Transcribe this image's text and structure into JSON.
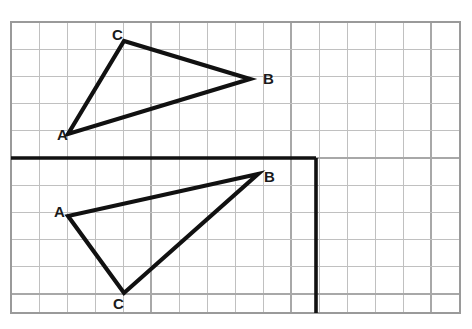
{
  "figure": {
    "background_color": "#ffffff",
    "grid": {
      "minor_color": "#c0c0c0",
      "major_color": "#a8a8a8",
      "border_color": "#9a9a9a",
      "left": 11,
      "top": 22,
      "right": 460,
      "bottom": 313,
      "cell_width": 28,
      "cell_height": 27.2,
      "columns": 16,
      "rows": 10.7,
      "major_every": 5
    },
    "axis": {
      "color": "#111111",
      "stroke_width": 3.6,
      "horizontal": {
        "x1": 11,
        "y1": 158,
        "x2": 316,
        "y2": 158
      },
      "vertical": {
        "x1": 316,
        "y1": 158,
        "x2": 316,
        "y2": 313
      }
    },
    "shapes": [
      {
        "name": "triangle-upper",
        "stroke_color": "#111111",
        "stroke_width": 4.2,
        "points": "68,134 124,41 250,79",
        "vertices": [
          {
            "label": "A",
            "x": 68,
            "y": 134,
            "label_x": 57,
            "label_y": 136
          },
          {
            "label": "C",
            "x": 124,
            "y": 41,
            "label_x": 112,
            "label_y": 36
          },
          {
            "label": "B",
            "x": 250,
            "y": 79,
            "label_x": 263,
            "label_y": 80
          }
        ]
      },
      {
        "name": "triangle-lower",
        "stroke_color": "#111111",
        "stroke_width": 4.2,
        "points": "68,216 124,293 258,174",
        "vertices": [
          {
            "label": "A",
            "x": 68,
            "y": 216,
            "label_x": 54,
            "label_y": 213
          },
          {
            "label": "C",
            "x": 124,
            "y": 293,
            "label_x": 113,
            "label_y": 305
          },
          {
            "label": "B",
            "x": 258,
            "y": 174,
            "label_x": 264,
            "label_y": 178
          }
        ]
      }
    ]
  }
}
